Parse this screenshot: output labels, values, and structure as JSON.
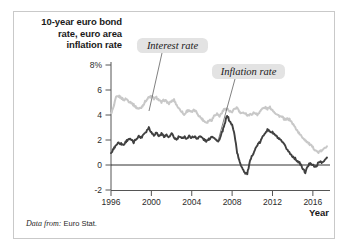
{
  "figure": {
    "title": "10-year euro bond rate, euro area inflation rate",
    "title_lines": [
      "10-year euro bond",
      "rate, euro area",
      "inflation rate"
    ],
    "source_lead": "Data from:",
    "source_body": "Euro Stat.",
    "border_color": "#c9c9c9",
    "background": "#ffffff"
  },
  "chart_data": {
    "type": "line",
    "title": "10-year euro bond rate, euro area inflation rate",
    "xlabel": "Year",
    "ylabel": "",
    "xlim": [
      1996,
      2017.5
    ],
    "ylim": [
      -2,
      8
    ],
    "grid": false,
    "legend_position": "inline-annotations",
    "x_tick_labels": [
      "1996",
      "2000",
      "2004",
      "2008",
      "2012",
      "2016"
    ],
    "x_ticks": [
      1996,
      2000,
      2004,
      2008,
      2012,
      2016
    ],
    "y_tick_labels": [
      "8%",
      "6",
      "4",
      "2",
      "0",
      "-2"
    ],
    "y_ticks": [
      8,
      6,
      4,
      2,
      0,
      -2
    ],
    "zero_line": 0,
    "series": [
      {
        "name": "Interest rate",
        "color": "#c8c8c8",
        "annotation_label": "Interest rate",
        "x": [
          1996.0,
          1996.25,
          1996.5,
          1996.75,
          1997.0,
          1997.25,
          1997.5,
          1997.75,
          1998.0,
          1998.25,
          1998.5,
          1998.75,
          1999.0,
          1999.25,
          1999.5,
          1999.75,
          2000.0,
          2000.25,
          2000.5,
          2000.75,
          2001.0,
          2001.25,
          2001.5,
          2001.75,
          2002.0,
          2002.25,
          2002.5,
          2002.75,
          2003.0,
          2003.25,
          2003.5,
          2003.75,
          2004.0,
          2004.25,
          2004.5,
          2004.75,
          2005.0,
          2005.25,
          2005.5,
          2005.75,
          2006.0,
          2006.25,
          2006.5,
          2006.75,
          2007.0,
          2007.25,
          2007.5,
          2007.75,
          2008.0,
          2008.25,
          2008.5,
          2008.75,
          2009.0,
          2009.25,
          2009.5,
          2009.75,
          2010.0,
          2010.25,
          2010.5,
          2010.75,
          2011.0,
          2011.25,
          2011.5,
          2011.75,
          2012.0,
          2012.25,
          2012.5,
          2012.75,
          2013.0,
          2013.25,
          2013.5,
          2013.75,
          2014.0,
          2014.25,
          2014.5,
          2014.75,
          2015.0,
          2015.25,
          2015.5,
          2015.75,
          2016.0,
          2016.25,
          2016.5,
          2016.75,
          2017.0,
          2017.4
        ],
        "values": [
          4.1,
          4.6,
          5.4,
          5.5,
          5.4,
          5.2,
          5.3,
          5.1,
          5.0,
          4.8,
          4.6,
          4.5,
          4.6,
          4.9,
          5.2,
          5.4,
          5.5,
          5.3,
          5.4,
          5.2,
          5.0,
          5.2,
          5.1,
          4.9,
          5.1,
          5.2,
          4.8,
          4.5,
          4.3,
          4.0,
          4.3,
          4.4,
          4.2,
          4.4,
          4.2,
          3.9,
          3.7,
          3.5,
          3.4,
          3.6,
          3.6,
          4.0,
          4.1,
          3.9,
          4.2,
          4.5,
          4.5,
          4.3,
          4.2,
          4.5,
          4.6,
          4.2,
          4.1,
          4.2,
          4.0,
          4.0,
          4.1,
          4.2,
          4.0,
          4.3,
          4.5,
          4.6,
          4.5,
          4.6,
          4.4,
          4.2,
          4.0,
          3.9,
          3.8,
          3.6,
          3.7,
          3.6,
          3.3,
          3.0,
          2.7,
          2.4,
          2.2,
          2.0,
          1.8,
          1.6,
          1.4,
          1.2,
          1.0,
          1.1,
          1.2,
          1.5
        ]
      },
      {
        "name": "Inflation rate",
        "color": "#404040",
        "annotation_label": "Inflation rate",
        "x": [
          1996.0,
          1996.25,
          1996.5,
          1996.75,
          1997.0,
          1997.25,
          1997.5,
          1997.75,
          1998.0,
          1998.25,
          1998.5,
          1998.75,
          1999.0,
          1999.25,
          1999.5,
          1999.75,
          2000.0,
          2000.25,
          2000.5,
          2000.75,
          2001.0,
          2001.25,
          2001.5,
          2001.75,
          2002.0,
          2002.25,
          2002.5,
          2002.75,
          2003.0,
          2003.25,
          2003.5,
          2003.75,
          2004.0,
          2004.25,
          2004.5,
          2004.75,
          2005.0,
          2005.25,
          2005.5,
          2005.75,
          2006.0,
          2006.25,
          2006.5,
          2006.75,
          2007.0,
          2007.25,
          2007.5,
          2007.75,
          2008.0,
          2008.25,
          2008.5,
          2008.75,
          2009.0,
          2009.25,
          2009.5,
          2009.75,
          2010.0,
          2010.25,
          2010.5,
          2010.75,
          2011.0,
          2011.25,
          2011.5,
          2011.75,
          2012.0,
          2012.25,
          2012.5,
          2012.75,
          2013.0,
          2013.25,
          2013.5,
          2013.75,
          2014.0,
          2014.25,
          2014.5,
          2014.75,
          2015.0,
          2015.25,
          2015.5,
          2015.75,
          2016.0,
          2016.25,
          2016.5,
          2016.75,
          2017.0,
          2017.4
        ],
        "values": [
          0.9,
          1.3,
          1.6,
          1.8,
          1.7,
          1.6,
          1.9,
          2.1,
          2.0,
          1.8,
          2.1,
          2.3,
          2.2,
          2.5,
          2.7,
          3.0,
          2.6,
          2.4,
          2.6,
          2.3,
          2.5,
          2.3,
          2.4,
          2.2,
          2.5,
          2.2,
          2.0,
          2.3,
          2.1,
          2.3,
          2.1,
          2.3,
          2.2,
          2.3,
          2.1,
          2.3,
          2.2,
          2.0,
          1.9,
          2.1,
          2.3,
          2.2,
          1.9,
          2.0,
          2.6,
          3.2,
          4.0,
          3.5,
          3.2,
          2.4,
          1.0,
          0.2,
          -0.2,
          -0.6,
          -0.7,
          0.2,
          0.8,
          1.2,
          1.6,
          1.8,
          2.2,
          2.6,
          2.8,
          2.7,
          2.6,
          2.4,
          2.2,
          2.0,
          1.8,
          1.5,
          1.2,
          0.9,
          0.7,
          0.5,
          0.3,
          0.1,
          -0.3,
          -0.6,
          -0.1,
          0.2,
          0.0,
          -0.2,
          0.1,
          0.3,
          0.2,
          0.6
        ]
      }
    ],
    "annotations": [
      {
        "label": "Interest rate",
        "box_x": 137,
        "box_y": 38,
        "box_w": 71,
        "box_h": 15,
        "leader_from_x": 162,
        "leader_from_y": 53,
        "leader_to_x": 149,
        "leader_to_y": 111
      },
      {
        "label": "Inflation rate",
        "box_x": 212,
        "box_y": 64,
        "box_w": 73,
        "box_h": 15,
        "leader_from_x": 235,
        "leader_from_y": 79,
        "leader_to_x": 218,
        "leader_to_y": 141
      }
    ]
  },
  "axes": {
    "x_axis_label": "Year",
    "y_unit_label": "8%"
  }
}
